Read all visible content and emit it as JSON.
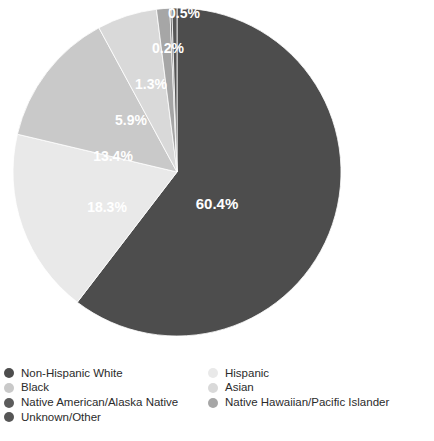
{
  "chart_data": {
    "type": "pie",
    "title": "",
    "subtitle": "",
    "xlabel": "",
    "ylabel": "",
    "legend_position": "bottom",
    "grid": false,
    "unit": "%",
    "categories": [
      "Non-Hispanic White",
      "Hispanic",
      "Black",
      "Asian",
      "Native Hawaiian/Pacific Islander",
      "Native American/Alaska Native",
      "Unknown/Other"
    ],
    "values": [
      60.4,
      18.3,
      13.4,
      5.9,
      1.3,
      0.2,
      0.5
    ],
    "labels": [
      "60.4%",
      "18.3%",
      "13.4%",
      "5.9%",
      "1.3%",
      "0.2%",
      "0.5%"
    ],
    "colors": [
      "#4d4d4d",
      "#e9e9e9",
      "#c9c9c9",
      "#d9d9d9",
      "#a6a6a6",
      "#5c5c5c",
      "#565656"
    ],
    "slices": [
      {
        "name": "Non-Hispanic White",
        "value": 60.4,
        "label": "60.4%",
        "color": "#4d4d4d"
      },
      {
        "name": "Hispanic",
        "value": 18.3,
        "label": "18.3%",
        "color": "#e9e9e9"
      },
      {
        "name": "Black",
        "value": 13.4,
        "label": "13.4%",
        "color": "#c9c9c9"
      },
      {
        "name": "Asian",
        "value": 5.9,
        "label": "5.9%",
        "color": "#d9d9d9"
      },
      {
        "name": "Native Hawaiian/Pacific Islander",
        "value": 1.3,
        "label": "1.3%",
        "color": "#a6a6a6"
      },
      {
        "name": "Native American/Alaska Native",
        "value": 0.2,
        "label": "0.2%",
        "color": "#5c5c5c"
      },
      {
        "name": "Unknown/Other",
        "value": 0.5,
        "label": "0.5%",
        "color": "#565656"
      }
    ]
  },
  "legend": {
    "left_column": [
      {
        "label": "Non-Hispanic White",
        "color": "#4d4d4d"
      },
      {
        "label": "Black",
        "color": "#c9c9c9"
      },
      {
        "label": "Native American/Alaska Native",
        "color": "#5c5c5c"
      },
      {
        "label": "Unknown/Other",
        "color": "#565656"
      }
    ],
    "right_column": [
      {
        "label": "Hispanic",
        "color": "#e9e9e9"
      },
      {
        "label": "Asian",
        "color": "#d9d9d9"
      },
      {
        "label": "Native Hawaiian/Pacific Islander",
        "color": "#a6a6a6"
      }
    ]
  },
  "footer": {
    "text": ""
  }
}
